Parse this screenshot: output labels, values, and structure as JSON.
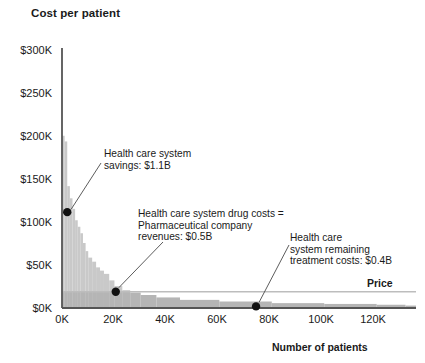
{
  "chart_data": {
    "type": "area",
    "title": "Cost per patient",
    "xlabel": "Number of patients",
    "ylabel": "Cost per patient",
    "xlim": [
      0,
      135000
    ],
    "ylim": [
      0,
      320000
    ],
    "grid": false,
    "legend_position": "none",
    "y_ticks": [
      "$0K",
      "$50K",
      "$100K",
      "$150K",
      "$200K",
      "$250K",
      "$300K"
    ],
    "y_tick_values": [
      0,
      50000,
      100000,
      150000,
      200000,
      250000,
      300000
    ],
    "x_ticks": [
      "0K",
      "20K",
      "40K",
      "60K",
      "80K",
      "100K",
      "120K"
    ],
    "x_tick_values": [
      0,
      20000,
      40000,
      60000,
      80000,
      100000,
      120000
    ],
    "price_level": 20000,
    "price_label": "Price",
    "series": [
      {
        "name": "Cost per patient (descending)",
        "x": [
          0,
          1000,
          2000,
          3000,
          4000,
          5000,
          6000,
          7000,
          8000,
          9000,
          10000,
          11500,
          13000,
          14500,
          16000,
          18000,
          20000,
          23000,
          26000,
          30000,
          36000,
          45000,
          60000,
          80000,
          100000,
          120000,
          131000
        ],
        "values": [
          212000,
          205000,
          150000,
          135000,
          122000,
          108000,
          100000,
          92000,
          80000,
          70000,
          62000,
          57000,
          50000,
          46000,
          42000,
          34000,
          27000,
          22000,
          19000,
          16000,
          13000,
          10000,
          8000,
          6000,
          5000,
          4000,
          3000
        ]
      }
    ],
    "markers": [
      {
        "label": "savings-marker",
        "x": 2000,
        "y": 118000
      },
      {
        "label": "drug-cost-marker",
        "x": 20500,
        "y": 20000
      },
      {
        "label": "remaining-cost-marker",
        "x": 74000,
        "y": 2000
      }
    ],
    "annotations": [
      {
        "name": "savings",
        "lines": [
          "Health care system",
          "savings: $1.1B"
        ],
        "value": "$1.1B"
      },
      {
        "name": "drug-costs",
        "lines": [
          "Health care system drug costs =",
          "Pharmaceutical company",
          "revenues: $0.5B"
        ],
        "value": "$0.5B"
      },
      {
        "name": "remaining-treatment-costs",
        "lines": [
          "Health care",
          "system remaining",
          "treatment costs: $0.4B"
        ],
        "value": "$0.4B"
      }
    ],
    "colors": {
      "area_above_price": "#c9c9c9",
      "area_below_price": "#b5b5b5",
      "baseline_band": "#d6d6d6",
      "axis": "#555555",
      "price_line": "#bdbdbd",
      "marker": "#111111",
      "leader": "#4a4a4a",
      "text": "#1a1a1a"
    }
  }
}
